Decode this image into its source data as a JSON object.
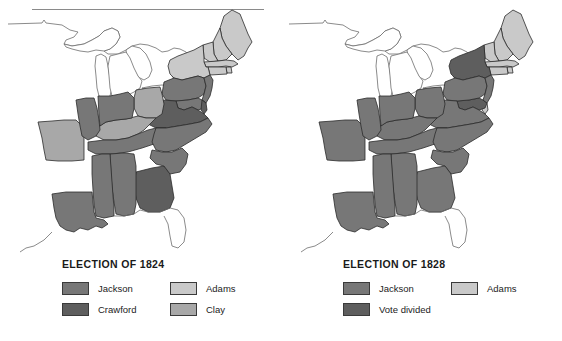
{
  "figure": {
    "background_color": "#ffffff"
  },
  "palette": {
    "jackson": "#777777",
    "crawford": "#5e5e5e",
    "adams": "#c9c9c9",
    "clay": "#a8a8a8",
    "vote_divided": "#5e5e5e",
    "unshaded": "#ffffff",
    "outline": "#2b2b2b",
    "coastline": "#6d6d6d"
  },
  "maps": [
    {
      "id": "election-1824",
      "title": "ELECTION OF 1824",
      "legend": [
        [
          {
            "label": "Jackson",
            "color_key": "jackson",
            "color": "#777777"
          },
          {
            "label": "Adams",
            "color_key": "adams",
            "color": "#c9c9c9"
          }
        ],
        [
          {
            "label": "Crawford",
            "color_key": "crawford",
            "color": "#5e5e5e"
          },
          {
            "label": "Clay",
            "color_key": "clay",
            "color": "#a8a8a8"
          }
        ]
      ],
      "states": [
        {
          "name": "Maine",
          "result": "Adams",
          "color": "#c9c9c9"
        },
        {
          "name": "New Hampshire",
          "result": "Adams",
          "color": "#c9c9c9"
        },
        {
          "name": "Vermont",
          "result": "Adams",
          "color": "#c9c9c9"
        },
        {
          "name": "Massachusetts",
          "result": "Adams",
          "color": "#c9c9c9"
        },
        {
          "name": "Rhode Island",
          "result": "Adams",
          "color": "#c9c9c9"
        },
        {
          "name": "Connecticut",
          "result": "Adams",
          "color": "#c9c9c9"
        },
        {
          "name": "New York",
          "result": "Adams",
          "color": "#c9c9c9"
        },
        {
          "name": "New Jersey",
          "result": "Jackson",
          "color": "#777777"
        },
        {
          "name": "Pennsylvania",
          "result": "Jackson",
          "color": "#777777"
        },
        {
          "name": "Delaware",
          "result": "Crawford",
          "color": "#5e5e5e"
        },
        {
          "name": "Maryland",
          "result": "Jackson",
          "color": "#777777"
        },
        {
          "name": "Virginia",
          "result": "Crawford",
          "color": "#5e5e5e"
        },
        {
          "name": "North Carolina",
          "result": "Jackson",
          "color": "#777777"
        },
        {
          "name": "South Carolina",
          "result": "Jackson",
          "color": "#777777"
        },
        {
          "name": "Georgia",
          "result": "Crawford",
          "color": "#5e5e5e"
        },
        {
          "name": "Ohio",
          "result": "Clay",
          "color": "#a8a8a8"
        },
        {
          "name": "Kentucky",
          "result": "Clay",
          "color": "#a8a8a8"
        },
        {
          "name": "Missouri",
          "result": "Clay",
          "color": "#a8a8a8"
        },
        {
          "name": "Indiana",
          "result": "Jackson",
          "color": "#777777"
        },
        {
          "name": "Illinois",
          "result": "Jackson",
          "color": "#777777"
        },
        {
          "name": "Tennessee",
          "result": "Jackson",
          "color": "#777777"
        },
        {
          "name": "Alabama",
          "result": "Jackson",
          "color": "#777777"
        },
        {
          "name": "Mississippi",
          "result": "Jackson",
          "color": "#777777"
        },
        {
          "name": "Louisiana",
          "result": "Jackson",
          "color": "#777777"
        }
      ]
    },
    {
      "id": "election-1828",
      "title": "ELECTION OF 1828",
      "legend": [
        [
          {
            "label": "Jackson",
            "color_key": "jackson",
            "color": "#777777"
          },
          {
            "label": "Adams",
            "color_key": "adams",
            "color": "#c9c9c9"
          }
        ],
        [
          {
            "label": "Vote divided",
            "color_key": "vote_divided",
            "color": "#5e5e5e"
          }
        ]
      ],
      "states": [
        {
          "name": "Maine",
          "result": "Adams",
          "color": "#c9c9c9"
        },
        {
          "name": "New Hampshire",
          "result": "Adams",
          "color": "#c9c9c9"
        },
        {
          "name": "Vermont",
          "result": "Adams",
          "color": "#c9c9c9"
        },
        {
          "name": "Massachusetts",
          "result": "Adams",
          "color": "#c9c9c9"
        },
        {
          "name": "Rhode Island",
          "result": "Adams",
          "color": "#c9c9c9"
        },
        {
          "name": "Connecticut",
          "result": "Adams",
          "color": "#c9c9c9"
        },
        {
          "name": "New York",
          "result": "Vote divided",
          "color": "#5e5e5e"
        },
        {
          "name": "New Jersey",
          "result": "Jackson",
          "color": "#777777"
        },
        {
          "name": "Pennsylvania",
          "result": "Jackson",
          "color": "#777777"
        },
        {
          "name": "Delaware",
          "result": "Adams",
          "color": "#c9c9c9"
        },
        {
          "name": "Maryland",
          "result": "Vote divided",
          "color": "#5e5e5e"
        },
        {
          "name": "Virginia",
          "result": "Jackson",
          "color": "#777777"
        },
        {
          "name": "North Carolina",
          "result": "Jackson",
          "color": "#777777"
        },
        {
          "name": "South Carolina",
          "result": "Jackson",
          "color": "#777777"
        },
        {
          "name": "Georgia",
          "result": "Jackson",
          "color": "#777777"
        },
        {
          "name": "Ohio",
          "result": "Jackson",
          "color": "#777777"
        },
        {
          "name": "Kentucky",
          "result": "Jackson",
          "color": "#777777"
        },
        {
          "name": "Missouri",
          "result": "Jackson",
          "color": "#777777"
        },
        {
          "name": "Indiana",
          "result": "Jackson",
          "color": "#777777"
        },
        {
          "name": "Illinois",
          "result": "Jackson",
          "color": "#777777"
        },
        {
          "name": "Tennessee",
          "result": "Jackson",
          "color": "#777777"
        },
        {
          "name": "Alabama",
          "result": "Jackson",
          "color": "#777777"
        },
        {
          "name": "Mississippi",
          "result": "Jackson",
          "color": "#777777"
        },
        {
          "name": "Louisiana",
          "result": "Jackson",
          "color": "#777777"
        }
      ]
    }
  ]
}
